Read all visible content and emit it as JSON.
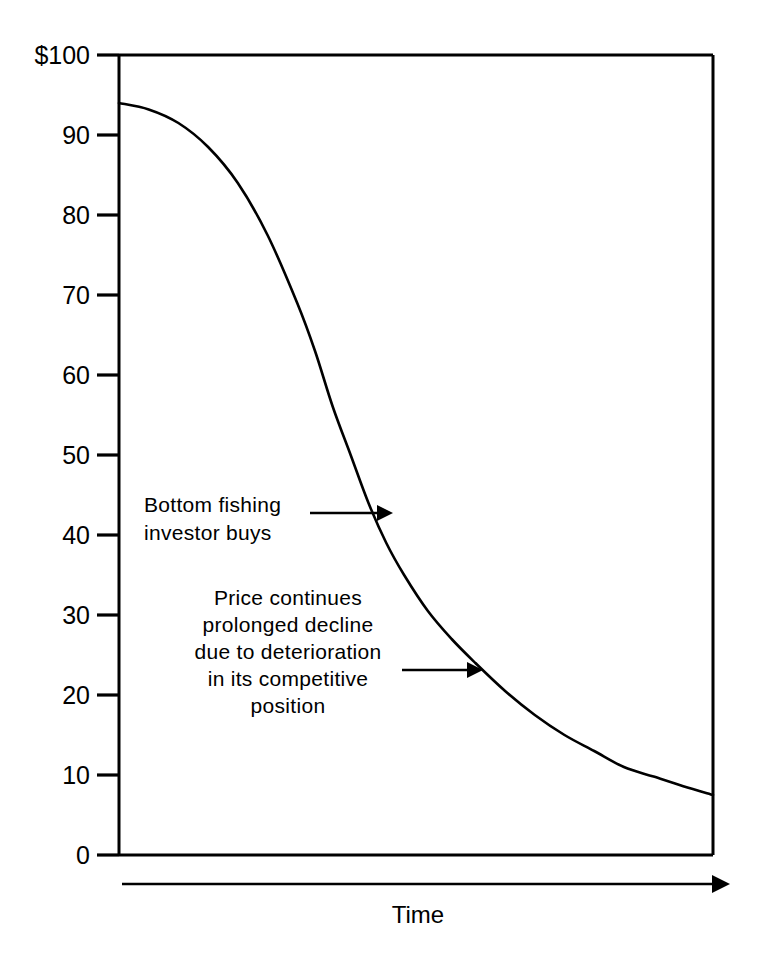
{
  "chart_data": {
    "type": "line",
    "title": "",
    "subtitle": "",
    "xlabel": "Time",
    "ylabel": "",
    "grid": false,
    "legend": false,
    "legend_position": "none",
    "xlim": [
      0,
      100
    ],
    "ylim": [
      0,
      100
    ],
    "x_axis_is_qualitative": true,
    "y_tick_labels": [
      "$100",
      "90",
      "80",
      "70",
      "60",
      "50",
      "40",
      "30",
      "20",
      "10",
      "0"
    ],
    "y_tick_values": [
      100,
      90,
      80,
      70,
      60,
      50,
      40,
      30,
      20,
      10,
      0
    ],
    "x_tick_labels": [],
    "series": [
      {
        "name": "Price",
        "x": [
          0,
          5,
          10,
          15,
          20,
          25,
          30,
          33,
          36,
          39,
          42,
          45,
          48,
          52,
          56,
          60,
          65,
          70,
          75,
          80,
          85,
          90,
          95,
          100
        ],
        "values": [
          94,
          93.2,
          91.5,
          88.5,
          84,
          77.5,
          69,
          63,
          56,
          50,
          44,
          39,
          35,
          30.5,
          27,
          24,
          20.5,
          17.5,
          15,
          13,
          11,
          9.8,
          8.6,
          7.5
        ]
      }
    ],
    "annotations": [
      {
        "id": "bottom-fishing",
        "lines": [
          "Bottom fishing",
          "investor buys"
        ],
        "align": "left",
        "arrow": {
          "from_value": 47,
          "to_value": 43,
          "direction": "right"
        }
      },
      {
        "id": "prolonged-decline",
        "lines": [
          "Price continues",
          "prolonged decline",
          "due to deterioration",
          "in its competitive",
          "position"
        ],
        "align": "center",
        "arrow": {
          "from_value": 27,
          "to_value": 24,
          "direction": "right"
        }
      }
    ],
    "colors": {
      "line": "#000000",
      "axis": "#000000",
      "text": "#000000",
      "background": "#ffffff"
    }
  },
  "axis": {
    "y_ticks": [
      {
        "label": "$100",
        "value": 100
      },
      {
        "label": "90",
        "value": 90
      },
      {
        "label": "80",
        "value": 80
      },
      {
        "label": "70",
        "value": 70
      },
      {
        "label": "60",
        "value": 60
      },
      {
        "label": "50",
        "value": 50
      },
      {
        "label": "40",
        "value": 40
      },
      {
        "label": "30",
        "value": 30
      },
      {
        "label": "20",
        "value": 20
      },
      {
        "label": "10",
        "value": 10
      },
      {
        "label": "0",
        "value": 0
      }
    ],
    "x_title": "Time"
  },
  "annotation_one": {
    "line_1": "Bottom fishing",
    "line_2": "investor buys"
  },
  "annotation_two": {
    "line_1": "Price continues",
    "line_2": "prolonged decline",
    "line_3": "due to deterioration",
    "line_4": "in its competitive",
    "line_5": "position"
  }
}
